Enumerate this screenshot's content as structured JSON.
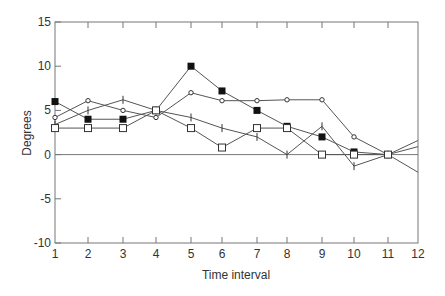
{
  "chart_data": {
    "type": "line",
    "title": "",
    "xlabel": "Time interval",
    "ylabel": "Degrees",
    "x": [
      1,
      2,
      3,
      4,
      5,
      6,
      7,
      8,
      9,
      10,
      11,
      12
    ],
    "xticks": [
      "1",
      "2",
      "3",
      "4",
      "5",
      "6",
      "7",
      "8",
      "9",
      "10",
      "11",
      "12"
    ],
    "yticks": [
      "15",
      "10",
      "5",
      "0",
      "-5",
      "-10"
    ],
    "ylim": [
      -10,
      15
    ],
    "xlim": [
      1,
      12
    ],
    "grid": false,
    "legend": null,
    "zero_line": true,
    "series": [
      {
        "name": "filled-square",
        "marker": "filled-square",
        "values": [
          6,
          4,
          4,
          5,
          10,
          7.2,
          5,
          3.2,
          2,
          0.3,
          0,
          null
        ]
      },
      {
        "name": "open-circle",
        "marker": "open-circle",
        "values": [
          4.2,
          6.1,
          5,
          4.2,
          7,
          6.1,
          6.1,
          6.2,
          6.2,
          2,
          0,
          -2
        ]
      },
      {
        "name": "plus",
        "marker": "plus",
        "values": [
          3.4,
          5,
          6.2,
          5,
          4.2,
          3,
          2,
          0,
          3.2,
          -1.3,
          0,
          1.6
        ]
      },
      {
        "name": "open-square",
        "marker": "open-square",
        "values": [
          3,
          3,
          3,
          5,
          3,
          0.8,
          3,
          3,
          0,
          0,
          0,
          0.9
        ]
      }
    ]
  },
  "colors": {
    "line": "#555555",
    "axis": "#777777",
    "marker_fill": "#111111"
  }
}
